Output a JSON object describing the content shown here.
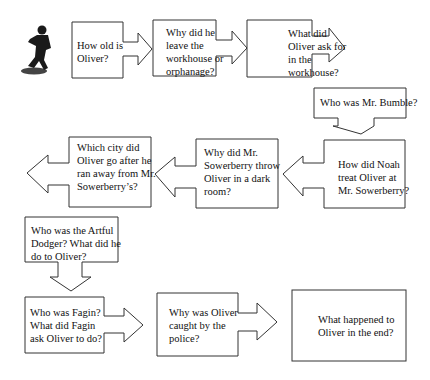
{
  "diagram": {
    "type": "flowchart",
    "topic": "Oliver Twist question sequence",
    "image": {
      "icon": "running-boy-silhouette-icon"
    },
    "nodes": [
      {
        "id": 1,
        "text": "How old is Oliver?",
        "lines": [
          "How old is",
          "Oliver?"
        ]
      },
      {
        "id": 2,
        "text": "Why did he leave the workhouse or orphanage?",
        "lines": [
          "Why did he",
          "leave the",
          "workhouse or",
          "orphanage?"
        ]
      },
      {
        "id": 3,
        "text": "What did Oliver ask for in the workhouse?",
        "lines": [
          "What did",
          "Oliver ask for",
          "in the",
          "workhouse?"
        ]
      },
      {
        "id": 4,
        "text": "Who was Mr. Bumble?",
        "lines": [
          "Who was Mr. Bumble?"
        ]
      },
      {
        "id": 5,
        "text": "How did Noah treat Oliver at Mr. Sowerberry?",
        "lines": [
          "How did Noah",
          "treat Oliver at",
          "Mr. Sowerberry?"
        ]
      },
      {
        "id": 6,
        "text": "Why did Mr. Sowerberry throw Oliver in a dark room?",
        "lines": [
          "Why did Mr.",
          "Sowerberry throw",
          "Oliver in a dark",
          "room?"
        ]
      },
      {
        "id": 7,
        "text": "Which city did Oliver go after he ran away from Mr. Sowerberry’s?",
        "lines": [
          "Which city did",
          "Oliver go after he",
          "ran away from Mr.",
          "Sowerberry’s?"
        ]
      },
      {
        "id": 8,
        "text": "Who was the Artful Dodger? What did he do to Oliver?",
        "lines": [
          "Who was the Artful",
          "Dodger? What did he",
          "do to Oliver?"
        ]
      },
      {
        "id": 9,
        "text": "Who was Fagin? What did Fagin ask Oliver to do?",
        "lines": [
          "Who was Fagin?",
          "What did Fagin",
          "ask Oliver to do?"
        ]
      },
      {
        "id": 10,
        "text": "Why was Oliver caught by the police?",
        "lines": [
          "Why was Oliver",
          "caught by the",
          "police?"
        ]
      },
      {
        "id": 11,
        "text": "What happened to Oliver in the end?",
        "lines": [
          "What happened to",
          "Oliver in the end?"
        ]
      }
    ],
    "edges": [
      {
        "from": 1,
        "to": 2,
        "direction": "right"
      },
      {
        "from": 2,
        "to": 3,
        "direction": "right"
      },
      {
        "from": 3,
        "to": 4,
        "direction": "right"
      },
      {
        "from": 4,
        "to": 5,
        "direction": "down"
      },
      {
        "from": 5,
        "to": 6,
        "direction": "left"
      },
      {
        "from": 6,
        "to": 7,
        "direction": "left"
      },
      {
        "from": 7,
        "to": 8,
        "direction": "left"
      },
      {
        "from": 8,
        "to": 9,
        "direction": "down"
      },
      {
        "from": 9,
        "to": 10,
        "direction": "right"
      },
      {
        "from": 10,
        "to": 11,
        "direction": "right"
      }
    ]
  }
}
